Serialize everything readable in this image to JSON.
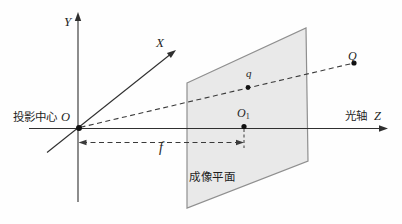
{
  "labels": {
    "y_axis": "Y",
    "x_axis": "X",
    "z_axis": "Z",
    "optical_axis": "光轴",
    "projection_center": "投影中心",
    "origin": "O",
    "principal_point_base": "O",
    "principal_point_sub": "1",
    "image_point": "q",
    "scene_point": "Q",
    "focal_length": "f",
    "image_plane": "成像平面"
  },
  "colors": {
    "background": "#fefefe",
    "plane_fill": "#e9e9e9",
    "plane_stroke": "#8f8f8f",
    "line": "#2f2f2f",
    "text": "#1f1f1f"
  }
}
